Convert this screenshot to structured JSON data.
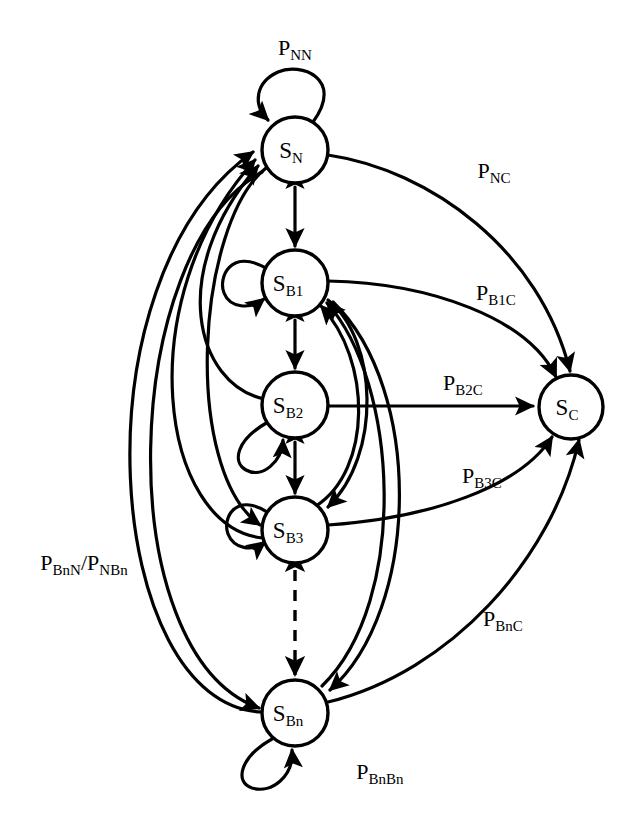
{
  "diagram": {
    "type": "state-transition-graph",
    "nodes": [
      {
        "id": "SN",
        "base": "S",
        "sub": "N",
        "label": "S_N",
        "cx": 295,
        "cy": 150,
        "r": 33
      },
      {
        "id": "SB1",
        "base": "S",
        "sub": "B1",
        "label": "S_B1",
        "cx": 295,
        "cy": 283,
        "r": 33
      },
      {
        "id": "SB2",
        "base": "S",
        "sub": "B2",
        "label": "S_B2",
        "cx": 295,
        "cy": 405,
        "r": 33
      },
      {
        "id": "SB3",
        "base": "S",
        "sub": "B3",
        "label": "S_B3",
        "cx": 295,
        "cy": 530,
        "r": 33
      },
      {
        "id": "SBn",
        "base": "S",
        "sub": "Bn",
        "label": "S_Bn",
        "cx": 295,
        "cy": 713,
        "r": 33
      },
      {
        "id": "SC",
        "base": "S",
        "sub": "C",
        "label": "S_C",
        "cx": 571,
        "cy": 407,
        "r": 32
      }
    ],
    "edge_labels": [
      {
        "id": "PNN",
        "base": "P",
        "sub": "NN",
        "x": 295,
        "y": 55,
        "text": "P_NN"
      },
      {
        "id": "PNC",
        "base": "P",
        "sub": "NC",
        "x": 494,
        "y": 178,
        "text": "P_NC"
      },
      {
        "id": "PB1C",
        "base": "P",
        "sub": "B1C",
        "x": 496,
        "y": 300,
        "text": "P_B1C"
      },
      {
        "id": "PB2C",
        "base": "P",
        "sub": "B2C",
        "x": 463,
        "y": 390,
        "text": "P_B2C"
      },
      {
        "id": "PB3C",
        "base": "P",
        "sub": "B3C",
        "x": 482,
        "y": 483,
        "text": "P_B3C"
      },
      {
        "id": "PBnC",
        "base": "P",
        "sub": "BnC",
        "x": 503,
        "y": 626,
        "text": "P_BnC"
      },
      {
        "id": "PBnBn",
        "base": "P",
        "sub": "BnBn",
        "x": 380,
        "y": 779,
        "text": "P_BnBn"
      },
      {
        "id": "PBnN",
        "base": "P",
        "sub": "BnN/NBn",
        "x": 84,
        "y": 570,
        "text": "P_BnN/P_NBn"
      }
    ],
    "self_loops": [
      "SN",
      "SB1",
      "SB2",
      "SB3",
      "SBn"
    ],
    "bidirectional_edges": [
      {
        "from": "SN",
        "to": "SB1"
      },
      {
        "from": "SB1",
        "to": "SB2"
      },
      {
        "from": "SB2",
        "to": "SB3"
      },
      {
        "from": "SB3",
        "to": "SBn",
        "style": "dashed"
      }
    ],
    "absorbing_edges": [
      {
        "from": "SN",
        "to": "SC",
        "label": "PNC"
      },
      {
        "from": "SB1",
        "to": "SC",
        "label": "PB1C"
      },
      {
        "from": "SB2",
        "to": "SC",
        "label": "PB2C"
      },
      {
        "from": "SB3",
        "to": "SC",
        "label": "PB3C"
      },
      {
        "from": "SBn",
        "to": "SC",
        "label": "PBnC"
      }
    ],
    "return_edges": [
      {
        "from": "SB2",
        "to": "SN"
      },
      {
        "from": "SB3",
        "to": "SN"
      },
      {
        "from": "SBn",
        "to": "SN",
        "label": "PBnN"
      },
      {
        "from": "SN",
        "to": "SB3"
      },
      {
        "from": "SN",
        "to": "SBn"
      },
      {
        "from": "SB3",
        "to": "SB1"
      },
      {
        "from": "SBn",
        "to": "SB1"
      },
      {
        "from": "SB1",
        "to": "SB3"
      },
      {
        "from": "SB1",
        "to": "SBn"
      }
    ]
  }
}
